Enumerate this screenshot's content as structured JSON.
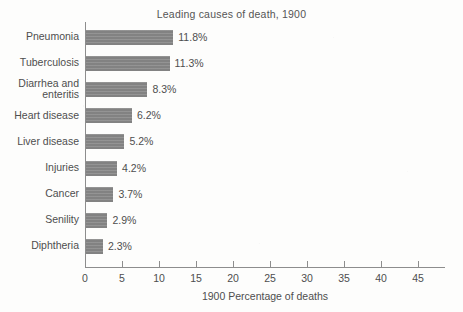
{
  "chart_data": {
    "type": "bar",
    "orientation": "horizontal",
    "title": "Leading causes of death, 1900",
    "xlabel": "1900 Percentage of deaths",
    "ylabel": "",
    "xlim": [
      0,
      45
    ],
    "xticks": [
      0,
      5,
      10,
      15,
      20,
      25,
      30,
      35,
      40,
      45
    ],
    "grid": false,
    "legend": null,
    "categories": [
      "Pneumonia",
      "Tuberculosis",
      "Diarrhea and enteritis",
      "Heart disease",
      "Liver disease",
      "Injuries",
      "Cancer",
      "Senility",
      "Diphtheria"
    ],
    "values": [
      11.8,
      11.3,
      8.3,
      6.2,
      5.2,
      4.2,
      3.7,
      2.9,
      2.3
    ],
    "data_labels": [
      "11.8%",
      "11.3%",
      "8.3%",
      "6.2%",
      "5.2%",
      "4.2%",
      "3.7%",
      "2.9%",
      "2.3%"
    ],
    "category_label_lines": [
      [
        "Pneumonia"
      ],
      [
        "Tuberculosis"
      ],
      [
        "Diarrhea and",
        "enteritis"
      ],
      [
        "Heart disease"
      ],
      [
        "Liver disease"
      ],
      [
        "Injuries"
      ],
      [
        "Cancer"
      ],
      [
        "Senility"
      ],
      [
        "Diphtheria"
      ]
    ],
    "colors": {
      "bar_fill": "#898989",
      "axis": "#8d8d8d",
      "text": "#4e4e4e",
      "background": "#fdfdfc"
    }
  }
}
